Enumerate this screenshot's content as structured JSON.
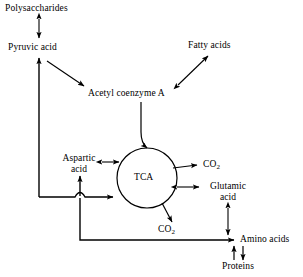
{
  "diagram": {
    "background_color": "#ffffff",
    "stroke_color": "#000000",
    "nodes": [
      {
        "id": "polysaccharides",
        "label": "Polysaccharides"
      },
      {
        "id": "pyruvic_acid",
        "label": "Pyruvic acid"
      },
      {
        "id": "fatty_acids",
        "label": "Fatty acids"
      },
      {
        "id": "acetyl_coa",
        "label": "Acetyl coenzyme A"
      },
      {
        "id": "aspartic_acid_l1",
        "label": "Aspartic"
      },
      {
        "id": "aspartic_acid_l2",
        "label": "acid"
      },
      {
        "id": "tca",
        "label": "TCA"
      },
      {
        "id": "co2_upper",
        "label": "CO",
        "subscript": "2"
      },
      {
        "id": "glutamic_l1",
        "label": "Glutamic"
      },
      {
        "id": "glutamic_l2",
        "label": "acid"
      },
      {
        "id": "co2_lower",
        "label": "CO",
        "subscript": "2"
      },
      {
        "id": "amino_acids",
        "label": "Amino acids"
      },
      {
        "id": "proteins",
        "label": "Proteins"
      }
    ],
    "edges": [
      {
        "id": "polysaccharides-pyruvic",
        "from": "polysaccharides",
        "to": "pyruvic_acid",
        "arrow": "double"
      },
      {
        "id": "pyruvic-acetyl",
        "from": "pyruvic_acid",
        "to": "acetyl_coa",
        "arrow": "single"
      },
      {
        "id": "acetyl-fatty",
        "from": "acetyl_coa",
        "to": "fatty_acids",
        "arrow": "double"
      },
      {
        "id": "acetyl-tca",
        "from": "acetyl_coa",
        "to": "tca",
        "arrow": "single"
      },
      {
        "id": "aspartic-tca",
        "from": "aspartic_acid_l1",
        "to": "tca",
        "arrow": "double"
      },
      {
        "id": "tca-co2-upper",
        "from": "tca",
        "to": "co2_upper",
        "arrow": "single"
      },
      {
        "id": "tca-glutamic",
        "from": "tca",
        "to": "glutamic_l1",
        "arrow": "double"
      },
      {
        "id": "tca-co2-lower",
        "from": "tca",
        "to": "co2_lower",
        "arrow": "single"
      },
      {
        "id": "feed-into-tca",
        "from": "amino_acids",
        "to": "tca",
        "arrow": "single"
      },
      {
        "id": "feed-into-aspartic",
        "from": "amino_acids",
        "to": "aspartic_acid_l1",
        "arrow": "single"
      },
      {
        "id": "feed-into-pyruvic",
        "from": "amino_acids",
        "to": "pyruvic_acid",
        "arrow": "single"
      },
      {
        "id": "bottom-to-amino",
        "from": "tca",
        "to": "amino_acids",
        "arrow": "single"
      },
      {
        "id": "glutamic-amino",
        "from": "glutamic_l1",
        "to": "amino_acids",
        "arrow": "double"
      },
      {
        "id": "amino-proteins-up",
        "from": "proteins",
        "to": "amino_acids",
        "arrow": "single"
      },
      {
        "id": "amino-proteins-down",
        "from": "amino_acids",
        "to": "proteins",
        "arrow": "single"
      }
    ]
  }
}
